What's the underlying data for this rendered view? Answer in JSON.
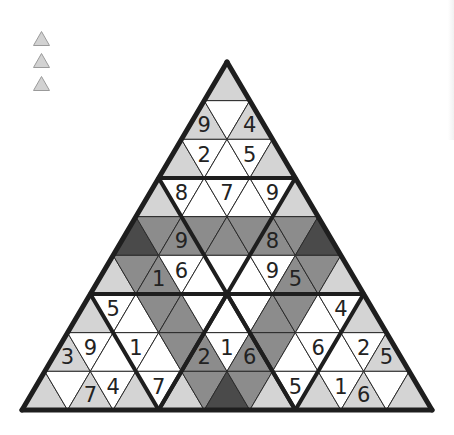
{
  "colors": {
    "white": "#ffffff",
    "light": "#d4d4d4",
    "mid": "#8c8c8c",
    "dark": "#4a4a4a",
    "thin_line": "#2a2a2a",
    "thick_line": "#1e1e1e",
    "digit": "#222222",
    "legend_fill": "#d2d2d2",
    "legend_stroke": "#9a9a9a"
  },
  "legend": {
    "items": [
      {
        "icon": "triangle-icon",
        "y": 31
      },
      {
        "icon": "triangle-icon",
        "y": 53
      },
      {
        "icon": "triangle-icon",
        "y": 76
      }
    ]
  },
  "puzzle": {
    "rows": 9,
    "apex": [
      227,
      62
    ],
    "base_y": 410,
    "base_left_x": 22,
    "base_right_x": 432,
    "cells": [
      [
        {
          "shade": "light",
          "digit": ""
        }
      ],
      [
        {
          "shade": "light",
          "digit": "9"
        },
        {
          "shade": "white",
          "digit": ""
        },
        {
          "shade": "light",
          "digit": "4"
        }
      ],
      [
        {
          "shade": "light",
          "digit": ""
        },
        {
          "shade": "white",
          "digit": "2"
        },
        {
          "shade": "white",
          "digit": ""
        },
        {
          "shade": "white",
          "digit": "5"
        },
        {
          "shade": "light",
          "digit": ""
        }
      ],
      [
        {
          "shade": "light",
          "digit": ""
        },
        {
          "shade": "white",
          "digit": "8"
        },
        {
          "shade": "white",
          "digit": ""
        },
        {
          "shade": "white",
          "digit": "7"
        },
        {
          "shade": "white",
          "digit": ""
        },
        {
          "shade": "white",
          "digit": "9"
        },
        {
          "shade": "light",
          "digit": ""
        }
      ],
      [
        {
          "shade": "dark",
          "digit": ""
        },
        {
          "shade": "mid",
          "digit": ""
        },
        {
          "shade": "mid",
          "digit": "9"
        },
        {
          "shade": "mid",
          "digit": ""
        },
        {
          "shade": "mid",
          "digit": ""
        },
        {
          "shade": "mid",
          "digit": ""
        },
        {
          "shade": "mid",
          "digit": "8"
        },
        {
          "shade": "mid",
          "digit": ""
        },
        {
          "shade": "dark",
          "digit": ""
        }
      ],
      [
        {
          "shade": "light",
          "digit": ""
        },
        {
          "shade": "mid",
          "digit": ""
        },
        {
          "shade": "mid",
          "digit": "1"
        },
        {
          "shade": "white",
          "digit": "6"
        },
        {
          "shade": "white",
          "digit": ""
        },
        {
          "shade": "white",
          "digit": ""
        },
        {
          "shade": "white",
          "digit": ""
        },
        {
          "shade": "white",
          "digit": "9"
        },
        {
          "shade": "mid",
          "digit": "5"
        },
        {
          "shade": "mid",
          "digit": ""
        },
        {
          "shade": "light",
          "digit": ""
        }
      ],
      [
        {
          "shade": "light",
          "digit": ""
        },
        {
          "shade": "white",
          "digit": "5"
        },
        {
          "shade": "white",
          "digit": ""
        },
        {
          "shade": "mid",
          "digit": ""
        },
        {
          "shade": "mid",
          "digit": ""
        },
        {
          "shade": "white",
          "digit": ""
        },
        {
          "shade": "white",
          "digit": ""
        },
        {
          "shade": "white",
          "digit": ""
        },
        {
          "shade": "mid",
          "digit": ""
        },
        {
          "shade": "mid",
          "digit": ""
        },
        {
          "shade": "white",
          "digit": ""
        },
        {
          "shade": "white",
          "digit": "4"
        },
        {
          "shade": "light",
          "digit": ""
        }
      ],
      [
        {
          "shade": "light",
          "digit": "3"
        },
        {
          "shade": "white",
          "digit": "9"
        },
        {
          "shade": "white",
          "digit": ""
        },
        {
          "shade": "white",
          "digit": "1"
        },
        {
          "shade": "white",
          "digit": ""
        },
        {
          "shade": "mid",
          "digit": ""
        },
        {
          "shade": "mid",
          "digit": "2"
        },
        {
          "shade": "white",
          "digit": "1"
        },
        {
          "shade": "mid",
          "digit": "6"
        },
        {
          "shade": "mid",
          "digit": ""
        },
        {
          "shade": "white",
          "digit": ""
        },
        {
          "shade": "white",
          "digit": "6"
        },
        {
          "shade": "white",
          "digit": ""
        },
        {
          "shade": "white",
          "digit": "2"
        },
        {
          "shade": "light",
          "digit": "5"
        }
      ],
      [
        {
          "shade": "light",
          "digit": ""
        },
        {
          "shade": "white",
          "digit": ""
        },
        {
          "shade": "light",
          "digit": "7"
        },
        {
          "shade": "white",
          "digit": "4"
        },
        {
          "shade": "light",
          "digit": ""
        },
        {
          "shade": "white",
          "digit": "7"
        },
        {
          "shade": "light",
          "digit": ""
        },
        {
          "shade": "mid",
          "digit": ""
        },
        {
          "shade": "dark",
          "digit": ""
        },
        {
          "shade": "mid",
          "digit": ""
        },
        {
          "shade": "light",
          "digit": ""
        },
        {
          "shade": "white",
          "digit": "5"
        },
        {
          "shade": "light",
          "digit": ""
        },
        {
          "shade": "white",
          "digit": "1"
        },
        {
          "shade": "light",
          "digit": "6"
        },
        {
          "shade": "white",
          "digit": ""
        },
        {
          "shade": "light",
          "digit": ""
        }
      ]
    ]
  }
}
